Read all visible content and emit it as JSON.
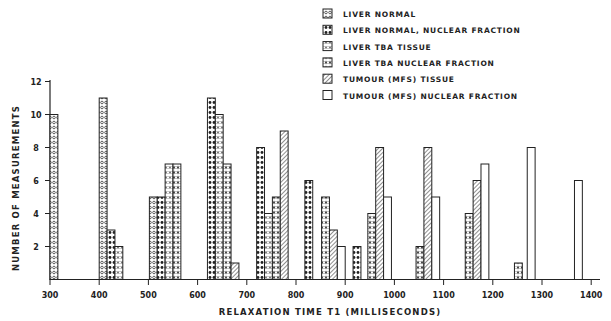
{
  "chart_data": {
    "type": "bar",
    "title": "",
    "xlabel": "RELAXATION TIME T1 (MILLISECONDS)",
    "ylabel": "NUMBER OF MEASUREMENTS",
    "xlim": [
      300,
      1400
    ],
    "ylim": [
      0,
      12
    ],
    "x_ticks": [
      300,
      400,
      500,
      600,
      700,
      800,
      900,
      1000,
      1100,
      1200,
      1300,
      1400
    ],
    "y_ticks": [
      2,
      4,
      6,
      8,
      10,
      12
    ],
    "grid": false,
    "legend_position": "top-right",
    "bar_width_ms": 16,
    "series": [
      {
        "key": "ln",
        "name": "LIVER NORMAL",
        "pattern": "open-circles",
        "bars": [
          {
            "x": 300,
            "value": 10
          },
          {
            "x": 400,
            "value": 11
          },
          {
            "x": 502,
            "value": 5
          }
        ]
      },
      {
        "key": "lnn",
        "name": "LIVER NORMAL, NUCLEAR FRACTION",
        "pattern": "filled-dots",
        "bars": [
          {
            "x": 416,
            "value": 3
          },
          {
            "x": 518,
            "value": 5
          },
          {
            "x": 620,
            "value": 11
          },
          {
            "x": 720,
            "value": 8
          },
          {
            "x": 818,
            "value": 6
          },
          {
            "x": 916,
            "value": 2
          }
        ]
      },
      {
        "key": "ltt",
        "name": "LIVER TBA TISSUE",
        "pattern": "crosses",
        "bars": [
          {
            "x": 432,
            "value": 2
          },
          {
            "x": 534,
            "value": 7
          },
          {
            "x": 636,
            "value": 10
          },
          {
            "x": 736,
            "value": 4
          }
        ]
      },
      {
        "key": "ltn",
        "name": "LIVER TBA NUCLEAR FRACTION",
        "pattern": "asterisks",
        "bars": [
          {
            "x": 550,
            "value": 7
          },
          {
            "x": 652,
            "value": 7
          },
          {
            "x": 752,
            "value": 5
          },
          {
            "x": 852,
            "value": 5
          },
          {
            "x": 946,
            "value": 4
          },
          {
            "x": 1044,
            "value": 2
          },
          {
            "x": 1144,
            "value": 4
          },
          {
            "x": 1244,
            "value": 1
          }
        ]
      },
      {
        "key": "tt",
        "name": "TUMOUR (MFS) TISSUE",
        "pattern": "hatched",
        "bars": [
          {
            "x": 668,
            "value": 1
          },
          {
            "x": 768,
            "value": 9
          },
          {
            "x": 868,
            "value": 3
          },
          {
            "x": 962,
            "value": 8
          },
          {
            "x": 1060,
            "value": 8
          },
          {
            "x": 1160,
            "value": 6
          }
        ]
      },
      {
        "key": "tn",
        "name": "TUMOUR (MFS) NUCLEAR FRACTION",
        "pattern": "open",
        "bars": [
          {
            "x": 884,
            "value": 2
          },
          {
            "x": 978,
            "value": 5
          },
          {
            "x": 1076,
            "value": 5
          },
          {
            "x": 1176,
            "value": 7
          },
          {
            "x": 1270,
            "value": 8
          },
          {
            "x": 1366,
            "value": 6
          }
        ]
      }
    ]
  }
}
